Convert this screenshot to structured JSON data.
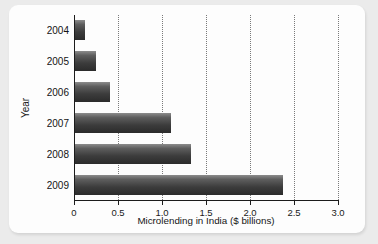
{
  "chart_data": {
    "type": "bar",
    "orientation": "horizontal",
    "title": "",
    "xlabel": "Microlending in India ($ billions)",
    "ylabel": "Year",
    "categories": [
      "2004",
      "2005",
      "2006",
      "2007",
      "2008",
      "2009"
    ],
    "values": [
      0.13,
      0.25,
      0.41,
      1.1,
      1.33,
      2.38
    ],
    "xlim": [
      0,
      3.0
    ],
    "xticks": [
      0,
      0.5,
      1.0,
      1.5,
      2.0,
      2.5,
      3.0
    ],
    "xtick_labels": [
      "0",
      "0.5",
      "1.0",
      "1.5",
      "2.0",
      "2.5",
      "3.0"
    ],
    "grid": "vertical-dotted",
    "legend": "none",
    "bar_color": "#3c3c3c",
    "grid_color": "#7a7a7a",
    "axis_color": "#1c1c1c",
    "background": "#fdfdfd",
    "page_background": "#ebebeb"
  }
}
